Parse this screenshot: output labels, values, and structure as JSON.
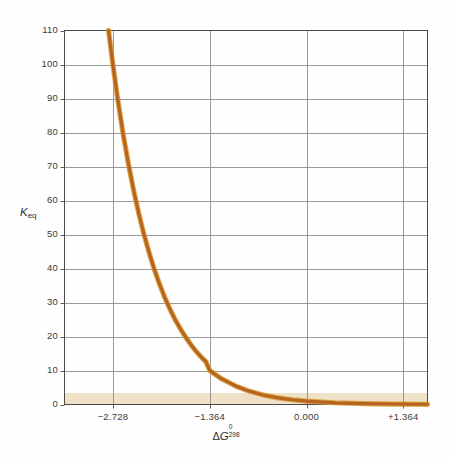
{
  "figure": {
    "background_color": "#fefefe",
    "frame_color": "#4a4a4a",
    "grid_color": "#8e8e8e",
    "curve_color": "#b5651d",
    "curve_highlight_color": "#d8962f",
    "shadow_band_color": "#e8d5b0"
  },
  "chart_data": {
    "type": "line",
    "title": "",
    "subtitle": "",
    "xlabel": "ΔG⁰₂₉₈",
    "xlabel_parts": {
      "delta": "Δ",
      "symbol": "G",
      "superscript": "0",
      "subscript": "298"
    },
    "ylabel": "Keq",
    "ylabel_parts": {
      "symbol": "K",
      "subscript": "eq"
    },
    "xlim": [
      -3.41,
      1.705
    ],
    "ylim": [
      0,
      110
    ],
    "grid": true,
    "legend": null,
    "x_ticks": [
      -2.728,
      -1.364,
      0.0,
      1.364
    ],
    "x_tick_labels": [
      "−2.728",
      "−1.364",
      "0.000",
      "+1.364"
    ],
    "y_ticks": [
      0,
      10,
      20,
      30,
      40,
      50,
      60,
      70,
      80,
      90,
      100,
      110
    ],
    "y_tick_labels": [
      "0",
      "10",
      "20",
      "30",
      "40",
      "50",
      "60",
      "70",
      "80",
      "90",
      "100",
      "110"
    ],
    "equation": "Keq = 10^(-dG/1.364)",
    "series": [
      {
        "name": "Keq vs dG",
        "color": "#b5651d",
        "points": [
          {
            "x": -2.7894,
            "y": 110.0
          },
          {
            "x": -2.728,
            "y": 100.0
          },
          {
            "x": -2.6552,
            "y": 89.1
          },
          {
            "x": -2.5824,
            "y": 79.4
          },
          {
            "x": -2.5096,
            "y": 70.8
          },
          {
            "x": -2.4368,
            "y": 63.1
          },
          {
            "x": -2.364,
            "y": 56.2
          },
          {
            "x": -2.2912,
            "y": 50.1
          },
          {
            "x": -2.2184,
            "y": 44.7
          },
          {
            "x": -2.1456,
            "y": 39.8
          },
          {
            "x": -2.0728,
            "y": 35.5
          },
          {
            "x": -2.0,
            "y": 31.6
          },
          {
            "x": -1.9272,
            "y": 28.2
          },
          {
            "x": -1.8544,
            "y": 25.1
          },
          {
            "x": -1.7816,
            "y": 22.4
          },
          {
            "x": -1.7088,
            "y": 20.0
          },
          {
            "x": -1.636,
            "y": 17.8
          },
          {
            "x": -1.5632,
            "y": 15.8
          },
          {
            "x": -1.4904,
            "y": 14.1
          },
          {
            "x": -1.4176,
            "y": 12.6
          },
          {
            "x": -1.364,
            "y": 10.0
          },
          {
            "x": -1.2,
            "y": 7.6
          },
          {
            "x": -1.0,
            "y": 5.45
          },
          {
            "x": -0.8,
            "y": 3.87
          },
          {
            "x": -0.6,
            "y": 2.75
          },
          {
            "x": -0.4,
            "y": 1.96
          },
          {
            "x": -0.2,
            "y": 1.4
          },
          {
            "x": 0.0,
            "y": 1.0
          },
          {
            "x": 0.4,
            "y": 0.51
          },
          {
            "x": 0.8,
            "y": 0.26
          },
          {
            "x": 1.2,
            "y": 0.13
          },
          {
            "x": 1.364,
            "y": 0.1
          },
          {
            "x": 1.705,
            "y": 0.056
          }
        ]
      }
    ]
  }
}
